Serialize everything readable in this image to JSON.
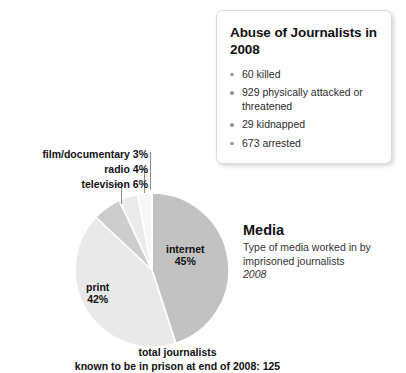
{
  "callout": {
    "title": "Abuse of Journalists in 2008",
    "items": [
      "60 killed",
      "929 physically attacked or threatened",
      "29 kidnapped",
      "673 arrested"
    ]
  },
  "media": {
    "title": "Media",
    "description": "Type of media worked in by imprisoned journalists",
    "year": "2008"
  },
  "caption": {
    "line1": "total journalists",
    "line2": "known to be in prison at end of 2008: 125"
  },
  "labels": {
    "internet": "internet",
    "internet_pct": "45%",
    "print": "print",
    "print_pct": "42%",
    "television": "television 6%",
    "radio": "radio 4%",
    "film": "film/documentary 3%"
  },
  "chart_data": {
    "type": "pie",
    "title": "Media",
    "subtitle": "Type of media worked in by imprisoned journalists",
    "year": "2008",
    "unit": "percent",
    "total_label": "total journalists known to be in prison at end of 2008: 125",
    "total": 125,
    "categories": [
      "internet",
      "print",
      "television",
      "radio",
      "film/documentary"
    ],
    "values": [
      45,
      42,
      6,
      4,
      3
    ],
    "colors": [
      "#c2c2c2",
      "#e9e9e9",
      "#cdcdcd",
      "#ebebeb",
      "#f7f7f7"
    ],
    "start_angle": 0,
    "direction": "clockwise",
    "legend": "none",
    "labels_inside": [
      "internet 45%",
      "print 42%"
    ],
    "labels_outside": [
      "television 6%",
      "radio 4%",
      "film/documentary 3%"
    ]
  }
}
